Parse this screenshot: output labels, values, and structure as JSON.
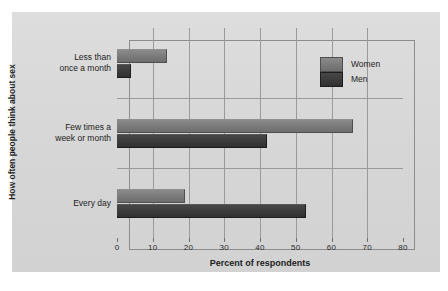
{
  "chart_data": {
    "type": "bar",
    "orientation": "horizontal",
    "title": "",
    "xlabel": "Percent of respondents",
    "ylabel": "How often people think about sex",
    "xlim": [
      0,
      80
    ],
    "xticks": [
      0,
      10,
      20,
      30,
      40,
      50,
      60,
      70,
      80
    ],
    "grid": true,
    "legend_position": "top-right",
    "categories": [
      "Less than once a month",
      "Few times a week or month",
      "Every day"
    ],
    "category_lines": [
      [
        "Less than",
        "once a month"
      ],
      [
        "Few times a",
        "week or month"
      ],
      [
        "Every day"
      ]
    ],
    "series": [
      {
        "name": "Women",
        "color": "#7b7b7b",
        "values": [
          14,
          66,
          19
        ]
      },
      {
        "name": "Men",
        "color": "#3a3a3a",
        "values": [
          4,
          42,
          53
        ]
      }
    ]
  },
  "legend": {
    "items": [
      {
        "label": "Women"
      },
      {
        "label": "Men"
      }
    ]
  },
  "axis": {
    "x_tick_labels": [
      "0",
      "10",
      "20",
      "30",
      "40",
      "50",
      "60",
      "70",
      "80"
    ],
    "x_title": "Percent of respondents",
    "y_title": "How often people think about sex"
  }
}
